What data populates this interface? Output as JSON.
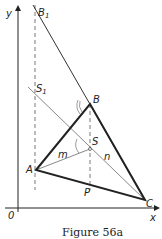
{
  "figure": {
    "caption": "Figure 56a",
    "labels": {
      "y_axis": "y",
      "x_axis": "x",
      "origin": "0",
      "B1": "B",
      "B1_sub": "1",
      "S1": "S",
      "S1_sub": "1",
      "B": "B",
      "A": "A",
      "C": "C",
      "S": "S",
      "P": "P",
      "m": "m",
      "n": "n"
    },
    "colors": {
      "ink": "#222222",
      "thin": "#555555"
    }
  }
}
